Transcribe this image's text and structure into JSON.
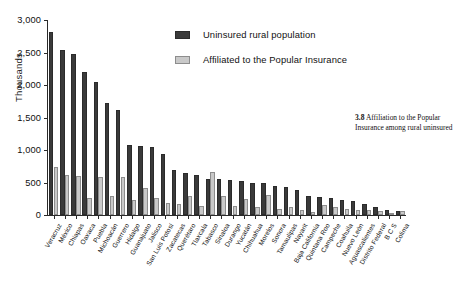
{
  "caption": {
    "number": "3.8",
    "text": "Affiliation to the Popular Insurance among rural uninsured"
  },
  "legend": {
    "position": "top-center",
    "items": [
      {
        "label": "Uninsured rural population",
        "color": "#3a3a3a",
        "icon": "legend-swatch-dark"
      },
      {
        "label": "Affiliated to the Popular Insurance",
        "color": "#c9c9c9",
        "icon": "legend-swatch-light"
      }
    ]
  },
  "axes": {
    "ylabel": "Thousands",
    "xlabel": "",
    "yticks": [
      "0",
      "500",
      "1,000",
      "1,500",
      "2,000",
      "2,500",
      "3,000"
    ],
    "ytick_values": [
      0,
      500,
      1000,
      1500,
      2000,
      2500,
      3000
    ],
    "ylim": [
      0,
      3000
    ],
    "grid": false
  },
  "chart_data": {
    "type": "bar",
    "title": "Affiliation to the Popular Insurance among rural uninsured",
    "xlabel": "",
    "ylabel": "Thousands",
    "ylim": [
      0,
      3000
    ],
    "grid": false,
    "legend_position": "top-center",
    "categories": [
      "Veracruz",
      "México",
      "Chiapas",
      "Oaxaca",
      "Puebla",
      "Michoacán",
      "Guerrero",
      "Hidalgo",
      "Guanajuato",
      "Jalisco",
      "San Luis Potosí",
      "Zacatecas",
      "Querétaro",
      "Tlaxcala",
      "Tabasco",
      "Sinaloa",
      "Durango",
      "Yucatán",
      "Chihuahua",
      "Morelos",
      "Sonora",
      "Tamaulipas",
      "Nayarit",
      "Baja California",
      "Quintana Roo",
      "Campeche",
      "Coahuila",
      "Nuevo León",
      "Aguascalientes",
      "Distrito Federal",
      "B C S",
      "Colima"
    ],
    "series": [
      {
        "name": "Uninsured rural population",
        "color": "#3a3a3a",
        "values": [
          2810,
          2535,
          2480,
          2205,
          2040,
          1730,
          1620,
          1080,
          1065,
          1040,
          940,
          700,
          640,
          620,
          560,
          555,
          540,
          530,
          500,
          495,
          450,
          430,
          390,
          300,
          280,
          255,
          235,
          215,
          165,
          130,
          70,
          60
        ]
      },
      {
        "name": "Affiliated to the Popular Insurance",
        "color": "#c9c9c9",
        "values": [
          735,
          620,
          600,
          265,
          580,
          300,
          580,
          230,
          420,
          260,
          190,
          165,
          300,
          135,
          660,
          290,
          135,
          245,
          120,
          310,
          85,
          130,
          70,
          40,
          160,
          130,
          95,
          70,
          75,
          55,
          30,
          65
        ]
      }
    ]
  }
}
